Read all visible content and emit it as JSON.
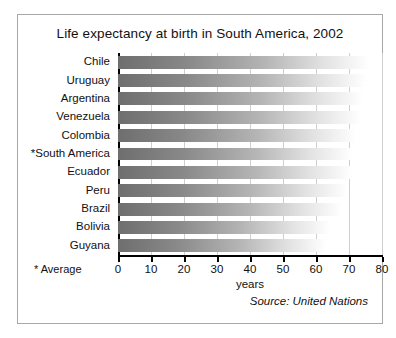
{
  "chart_data": {
    "type": "bar",
    "orientation": "horizontal",
    "title": "Life expectancy at birth in South America, 2002",
    "xlabel": "years",
    "ylabel": "",
    "xlim": [
      0,
      80
    ],
    "xticks": [
      0,
      10,
      20,
      30,
      40,
      50,
      60,
      70,
      80
    ],
    "grid": true,
    "legend": false,
    "categories": [
      "Chile",
      "Uruguay",
      "Argentina",
      "Venezuela",
      "Colombia",
      "*South America",
      "Ecuador",
      "Peru",
      "Brazil",
      "Bolivia",
      "Guyana"
    ],
    "values": [
      76.0,
      75.2,
      74.1,
      73.6,
      72.2,
      71.0,
      70.8,
      69.4,
      68.0,
      64.1,
      63.1
    ],
    "footnote": "* Average",
    "source": "Source: United Nations",
    "bar_gradient": {
      "start_color": "#6e6e6e",
      "end_color": "#ffffff"
    }
  },
  "figure": {
    "border_color": "#a8a8a8",
    "background": "#ffffff"
  }
}
